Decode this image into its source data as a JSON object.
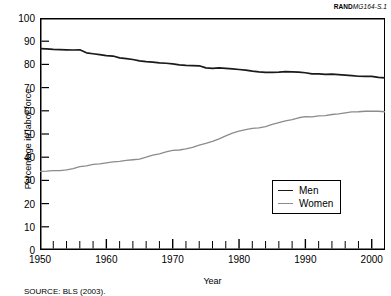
{
  "figure": {
    "rand_prefix": "RAND",
    "rand_number": "MG164-S.1",
    "source_note": "SOURCE: BLS (2003)."
  },
  "legend": {
    "position": "inside-lower-right",
    "entries": [
      {
        "label": "Men",
        "color": "#1a1a1a"
      },
      {
        "label": "Women",
        "color": "#8c8c8c"
      }
    ]
  },
  "chart_data": {
    "type": "line",
    "title": "",
    "xlabel": "Year",
    "ylabel": "Percentage in labor force",
    "xlim": [
      1950,
      2002
    ],
    "ylim": [
      0,
      100
    ],
    "yticks": [
      0,
      10,
      20,
      30,
      40,
      50,
      60,
      70,
      80,
      90,
      100
    ],
    "xticks": [
      1950,
      1960,
      1970,
      1980,
      1990,
      2000
    ],
    "xtick_minor_step": 2,
    "grid": false,
    "x": [
      1950,
      1951,
      1952,
      1953,
      1954,
      1955,
      1956,
      1957,
      1958,
      1959,
      1960,
      1961,
      1962,
      1963,
      1964,
      1965,
      1966,
      1967,
      1968,
      1969,
      1970,
      1971,
      1972,
      1973,
      1974,
      1975,
      1976,
      1977,
      1978,
      1979,
      1980,
      1981,
      1982,
      1983,
      1984,
      1985,
      1986,
      1987,
      1988,
      1989,
      1990,
      1991,
      1992,
      1993,
      1994,
      1995,
      1996,
      1997,
      1998,
      1999,
      2000,
      2001,
      2002
    ],
    "series": [
      {
        "name": "Men",
        "color": "#1a1a1a",
        "values": [
          86.8,
          86.7,
          86.5,
          86.4,
          86.3,
          86.2,
          86.3,
          85.0,
          84.6,
          84.2,
          83.8,
          83.6,
          82.8,
          82.5,
          82.1,
          81.5,
          81.2,
          81.0,
          80.7,
          80.5,
          80.2,
          79.8,
          79.6,
          79.5,
          79.4,
          78.5,
          78.3,
          78.5,
          78.3,
          78.1,
          77.8,
          77.5,
          77.1,
          76.8,
          76.6,
          76.6,
          76.7,
          76.9,
          76.8,
          76.7,
          76.4,
          75.9,
          75.9,
          75.7,
          75.8,
          75.6,
          75.4,
          75.2,
          74.9,
          74.8,
          74.8,
          74.4,
          74.2
        ]
      },
      {
        "name": "Women",
        "color": "#8c8c8c",
        "values": [
          33.9,
          34.0,
          34.2,
          34.2,
          34.5,
          35.1,
          35.9,
          36.3,
          36.9,
          37.1,
          37.6,
          38.0,
          38.2,
          38.6,
          38.9,
          39.2,
          40.0,
          40.9,
          41.4,
          42.3,
          42.9,
          43.1,
          43.6,
          44.2,
          45.2,
          46.0,
          46.8,
          47.9,
          49.2,
          50.4,
          51.2,
          51.9,
          52.4,
          52.6,
          53.2,
          54.1,
          54.9,
          55.7,
          56.2,
          57.0,
          57.5,
          57.4,
          57.8,
          57.9,
          58.4,
          58.7,
          59.1,
          59.5,
          59.6,
          59.8,
          59.9,
          59.8,
          59.6
        ]
      }
    ]
  }
}
